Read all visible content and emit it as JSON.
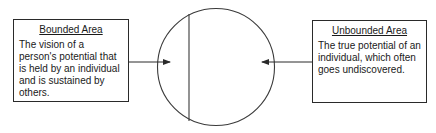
{
  "diagram": {
    "type": "concept-diagram",
    "left_box": {
      "title": "Bounded Area",
      "body": "The vision of a person's potential that is held by an individual and is sustained by others."
    },
    "right_box": {
      "title": "Unbounded Area",
      "body": "The true potential of an individual, which often goes undiscovered."
    },
    "circle": {
      "description": "Circle divided by a vertical line near its left edge; small left segment is the bounded area, larger right region is the unbounded area"
    },
    "arrows": [
      {
        "from": "left_box",
        "to": "circle-left-segment"
      },
      {
        "from": "right_box",
        "to": "circle-right-region"
      }
    ],
    "colors": {
      "stroke": "#2a2a2a",
      "background": "#ffffff",
      "text": "#1a1a1a"
    }
  }
}
